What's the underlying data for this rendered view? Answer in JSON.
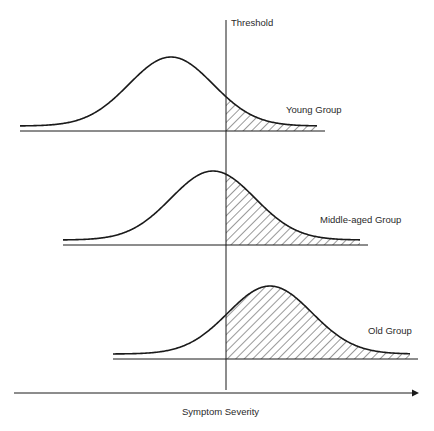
{
  "diagram": {
    "threshold_label": "Threshold",
    "x_axis_label": "Symptom Severity",
    "groups": [
      {
        "name": "Young Group",
        "label": "Young Group",
        "peak_x": 171,
        "baseline_y": 131,
        "peak_y": 57,
        "line_x1": 20,
        "line_x2": 325
      },
      {
        "name": "Middle-aged Group",
        "label": "Middle-aged Group",
        "peak_x": 213,
        "baseline_y": 245,
        "peak_y": 171,
        "line_x1": 63,
        "line_x2": 368
      },
      {
        "name": "Old Group",
        "label": "Old Group",
        "peak_x": 270,
        "baseline_y": 359,
        "peak_y": 286,
        "line_x1": 113,
        "line_x2": 418
      }
    ],
    "threshold_x": 226,
    "colors": {
      "line": "#1a1a1a",
      "hatch": "#333333",
      "background": "#ffffff"
    }
  },
  "chart_data": {
    "type": "area",
    "title": "",
    "xlabel": "Symptom Severity",
    "ylabel": "",
    "annotations": [
      "Threshold"
    ],
    "series": [
      {
        "name": "Young Group",
        "distribution": "normal",
        "relative_mean_vs_threshold": "below",
        "shaded_region": "right of threshold (small tail)"
      },
      {
        "name": "Middle-aged Group",
        "distribution": "normal",
        "relative_mean_vs_threshold": "near/just below",
        "shaded_region": "right of threshold (about half)"
      },
      {
        "name": "Old Group",
        "distribution": "normal",
        "relative_mean_vs_threshold": "above",
        "shaded_region": "right of threshold (majority)"
      }
    ],
    "grid": false,
    "legend": "inline labels to the right of each curve"
  }
}
